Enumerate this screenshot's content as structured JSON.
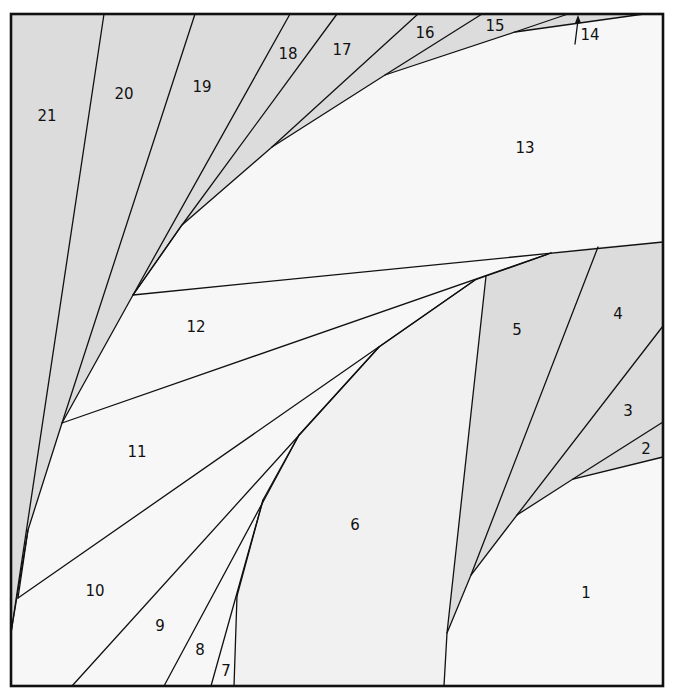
{
  "diagram": {
    "type": "foundation-paper-piecing-pattern",
    "colors": {
      "shaded": "#dcdcdc",
      "unshaded": "#f7f7f7",
      "line": "#111111"
    },
    "pieces": [
      {
        "id": "1",
        "label": "1",
        "shaded": false,
        "x": 586,
        "y": 593
      },
      {
        "id": "2",
        "label": "2",
        "shaded": true,
        "x": 646,
        "y": 449
      },
      {
        "id": "3",
        "label": "3",
        "shaded": true,
        "x": 628,
        "y": 411
      },
      {
        "id": "4",
        "label": "4",
        "shaded": true,
        "x": 618,
        "y": 314
      },
      {
        "id": "5",
        "label": "5",
        "shaded": true,
        "x": 517,
        "y": 330
      },
      {
        "id": "6",
        "label": "6",
        "shaded": false,
        "x": 355,
        "y": 525
      },
      {
        "id": "7",
        "label": "7",
        "shaded": false,
        "x": 226,
        "y": 671
      },
      {
        "id": "8",
        "label": "8",
        "shaded": false,
        "x": 200,
        "y": 650
      },
      {
        "id": "9",
        "label": "9",
        "shaded": false,
        "x": 160,
        "y": 626
      },
      {
        "id": "10",
        "label": "10",
        "shaded": false,
        "x": 95,
        "y": 591
      },
      {
        "id": "11",
        "label": "11",
        "shaded": false,
        "x": 137,
        "y": 452
      },
      {
        "id": "12",
        "label": "12",
        "shaded": false,
        "x": 196,
        "y": 327
      },
      {
        "id": "13",
        "label": "13",
        "shaded": false,
        "x": 525,
        "y": 148
      },
      {
        "id": "14",
        "label": "14",
        "shaded": true,
        "x": 590,
        "y": 35
      },
      {
        "id": "15",
        "label": "15",
        "shaded": true,
        "x": 495,
        "y": 26
      },
      {
        "id": "16",
        "label": "16",
        "shaded": true,
        "x": 425,
        "y": 33
      },
      {
        "id": "17",
        "label": "17",
        "shaded": true,
        "x": 342,
        "y": 50
      },
      {
        "id": "18",
        "label": "18",
        "shaded": true,
        "x": 288,
        "y": 54
      },
      {
        "id": "19",
        "label": "19",
        "shaded": true,
        "x": 202,
        "y": 87
      },
      {
        "id": "20",
        "label": "20",
        "shaded": true,
        "x": 124,
        "y": 94
      },
      {
        "id": "21",
        "label": "21",
        "shaded": true,
        "x": 47,
        "y": 116
      }
    ],
    "annotations": [
      {
        "type": "arrow",
        "points_to": "14",
        "description": "small upward arrow pointing into thin piece 14"
      }
    ]
  }
}
